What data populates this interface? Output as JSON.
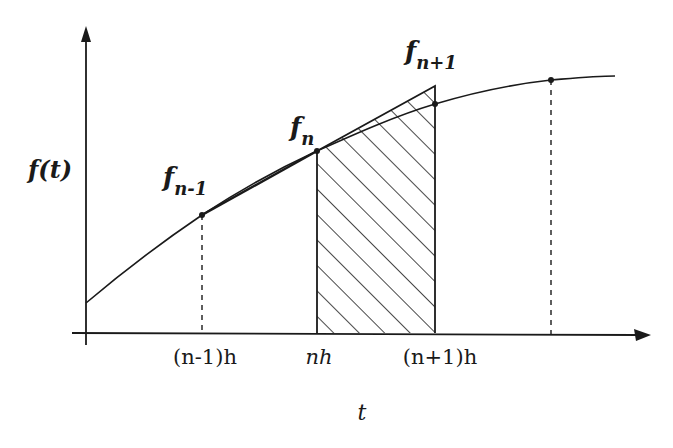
{
  "diagram": {
    "title": "",
    "y_axis_label": "f(t)",
    "x_axis_label": "t",
    "tick_labels": [
      "(n-1)h",
      "nh",
      "(n+1)h"
    ],
    "point_labels": {
      "f_prev": {
        "base": "f",
        "sub": "n-1"
      },
      "f_curr": {
        "base": "f",
        "sub": "n"
      },
      "f_next": {
        "base": "f",
        "sub": "n+1"
      }
    },
    "shaded_region": {
      "from": "nh",
      "to": "(n+1)h",
      "pattern": "diagonal-hatch"
    },
    "colors": {
      "ink": "#1a1a1a",
      "background": "#ffffff"
    }
  }
}
